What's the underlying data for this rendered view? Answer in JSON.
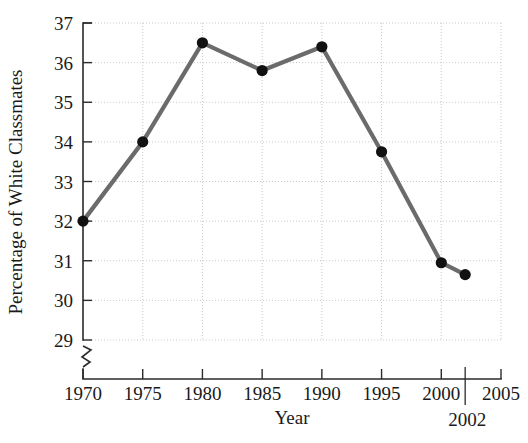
{
  "chart_data": {
    "type": "line",
    "title": "",
    "xlabel": "Year",
    "ylabel": "Percentage of White Classmates",
    "x": [
      1970,
      1975,
      1980,
      1985,
      1990,
      1995,
      2000,
      2002
    ],
    "values": [
      32.0,
      34.0,
      36.5,
      35.8,
      36.4,
      33.75,
      30.95,
      30.65
    ],
    "series": [
      {
        "name": "Percentage of White Classmates",
        "values": [
          32.0,
          34.0,
          36.5,
          35.8,
          36.4,
          33.75,
          30.95,
          30.65
        ]
      }
    ],
    "xlim": [
      1970,
      2005
    ],
    "ylim": [
      29,
      37
    ],
    "xticks": [
      1970,
      1975,
      1980,
      1985,
      1990,
      1995,
      2000,
      2005
    ],
    "xtick_labels": [
      "1970",
      "1975",
      "1980",
      "1985",
      "1990",
      "1995",
      "2000",
      "2005"
    ],
    "yticks": [
      29,
      30,
      31,
      32,
      33,
      34,
      35,
      36,
      37
    ],
    "ytick_labels": [
      "29",
      "30",
      "31",
      "32",
      "33",
      "34",
      "35",
      "36",
      "37"
    ],
    "grid": true,
    "legend": "none",
    "y_axis_break": true,
    "annotations": [
      {
        "name": "final-year-callout",
        "label": "2002",
        "x": 2002,
        "y": 29
      }
    ],
    "line_color": "#6b6b6b",
    "marker_color": "#111111",
    "grid_color": "#c9c9d2",
    "axis_color": "#2b2b2b"
  }
}
